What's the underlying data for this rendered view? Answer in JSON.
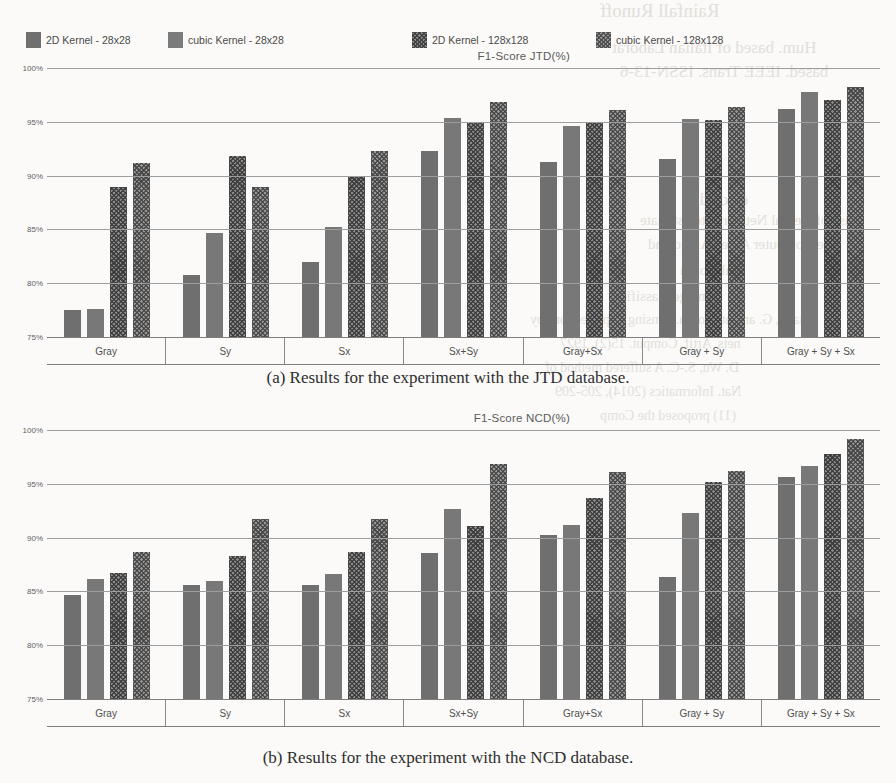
{
  "legend": {
    "items": [
      {
        "label": "2D Kernel - 28x28",
        "swatch": "solid-dark-swatch",
        "left": 26
      },
      {
        "label": "cubic Kernel - 28x28",
        "swatch": "solid-mid-swatch",
        "left": 168
      },
      {
        "label": "2D Kernel - 128x128",
        "swatch": "hatch-dark-swatch",
        "left": 412
      },
      {
        "label": "cubic Kernel - 128x128",
        "swatch": "hatch-mid-swatch",
        "left": 596
      }
    ]
  },
  "yticks": [
    "100%",
    "95%",
    "90%",
    "85%",
    "80%",
    "75%"
  ],
  "captions": {
    "a": "(a) Results for the experiment with the JTD database.",
    "b": "(b) Results for the experiment with the NCD database."
  },
  "bleed_text": [
    {
      "text": "Rainfall Runoff",
      "left": 600,
      "top": 0,
      "size": 19
    },
    {
      "text": "Hum. based of Italian Laborat",
      "left": 612,
      "top": 38,
      "size": 17
    },
    {
      "text": "based. IEEE Trans. ISSN-13-6",
      "left": 620,
      "top": 62,
      "size": 17
    },
    {
      "text": "elected",
      "left": 700,
      "top": 190,
      "size": 17
    },
    {
      "text": "lise of Neural Networks to estimate",
      "left": 640,
      "top": 212,
      "size": 15
    },
    {
      "text": "the Computer Aided Audio and",
      "left": 648,
      "top": 236,
      "size": 15
    },
    {
      "text": "ual Corhn",
      "left": 680,
      "top": 262,
      "size": 15
    },
    {
      "text": "image classific",
      "left": 620,
      "top": 288,
      "size": 15
    },
    {
      "text": "Huang, G. and at. Rosen. Sensing imperfections by",
      "left": 530,
      "top": 312,
      "size": 14
    },
    {
      "text": "nets. Artif. Comput. 15(2), 1927",
      "left": 560,
      "top": 336,
      "size": 14
    },
    {
      "text": "D. Wu, S.-C. A suffered method of",
      "left": 545,
      "top": 360,
      "size": 14
    },
    {
      "text": "Nat. Informatics (2014), 205-209",
      "left": 555,
      "top": 384,
      "size": 14
    },
    {
      "text": "(11) proposed the Comp",
      "left": 600,
      "top": 408,
      "size": 14
    }
  ],
  "chart_data": [
    {
      "type": "bar",
      "title": "F1-Score JTD(%)",
      "xlabel": "",
      "ylabel": "F1-Score JTD(%)",
      "ylim": [
        75,
        100
      ],
      "yticks": [
        100,
        95,
        90,
        85,
        80,
        75
      ],
      "grid": true,
      "legend_position": "top",
      "categories": [
        "Gray",
        "Sy",
        "Sx",
        "Sx+Sy",
        "Gray+Sx",
        "Gray + Sy",
        "Gray + Sy + Sx"
      ],
      "series": [
        {
          "name": "2D Kernel - 28x28",
          "values": [
            77.5,
            80.8,
            82.0,
            92.3,
            91.3,
            91.5,
            96.2
          ]
        },
        {
          "name": "cubic Kernel - 28x28",
          "values": [
            77.6,
            84.7,
            85.2,
            95.4,
            94.6,
            95.3,
            97.8
          ]
        },
        {
          "name": "2D Kernel - 128x128",
          "values": [
            88.9,
            91.8,
            90.0,
            94.9,
            95.0,
            95.2,
            97.0
          ]
        },
        {
          "name": "cubic Kernel - 128x128",
          "values": [
            91.2,
            88.9,
            92.3,
            96.8,
            96.1,
            96.4,
            98.2
          ]
        }
      ]
    },
    {
      "type": "bar",
      "title": "F1-Score NCD(%)",
      "xlabel": "",
      "ylabel": "F1-Score NCD(%)",
      "ylim": [
        75,
        100
      ],
      "yticks": [
        100,
        95,
        90,
        85,
        80,
        75
      ],
      "grid": true,
      "legend_position": "top",
      "categories": [
        "Gray",
        "Sy",
        "Sx",
        "Sx+Sy",
        "Gray+Sx",
        "Gray + Sy",
        "Gray + Sy + Sx"
      ],
      "series": [
        {
          "name": "2D Kernel - 28x28",
          "values": [
            84.7,
            85.6,
            85.6,
            88.6,
            90.2,
            86.3,
            95.6
          ]
        },
        {
          "name": "cubic Kernel - 28x28",
          "values": [
            86.2,
            86.0,
            86.6,
            92.7,
            91.2,
            92.3,
            96.7
          ]
        },
        {
          "name": "2D Kernel - 128x128",
          "values": [
            86.7,
            88.3,
            88.7,
            91.1,
            93.7,
            95.2,
            97.8
          ]
        },
        {
          "name": "cubic Kernel - 128x128",
          "values": [
            88.7,
            91.7,
            91.7,
            96.8,
            96.1,
            96.2,
            99.2
          ]
        }
      ]
    }
  ]
}
